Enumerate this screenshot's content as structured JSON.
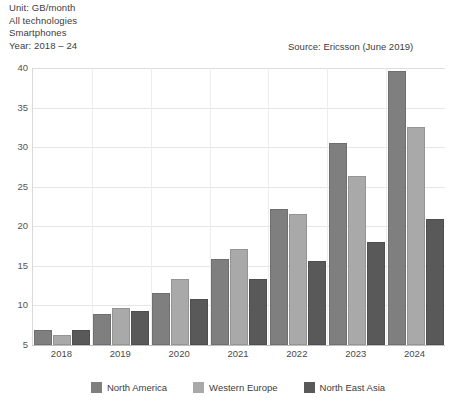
{
  "header": {
    "lines": [
      "Unit: GB/month",
      "All technologies",
      "Smartphones",
      "Year: 2018 – 24"
    ],
    "source": "Source: Ericsson (June 2019)"
  },
  "chart_data": {
    "type": "bar",
    "title": "",
    "subtitle": "",
    "xlabel": "",
    "ylabel": "",
    "unit": "GB/month",
    "categories": [
      "2018",
      "2019",
      "2020",
      "2021",
      "2022",
      "2023",
      "2024"
    ],
    "series": [
      {
        "name": "North America",
        "color": "#7f7f7f",
        "values": [
          6.9,
          8.9,
          11.6,
          15.9,
          22.2,
          30.5,
          39.6
        ]
      },
      {
        "name": "Western Europe",
        "color": "#a9a9a9",
        "values": [
          6.3,
          9.7,
          13.4,
          17.1,
          21.5,
          26.3,
          32.5
        ]
      },
      {
        "name": "North East Asia",
        "color": "#595959",
        "values": [
          6.9,
          9.3,
          10.8,
          13.3,
          15.6,
          18.0,
          20.9
        ]
      }
    ],
    "ylim": [
      5,
      40
    ],
    "yticks": [
      5,
      10,
      15,
      20,
      25,
      30,
      35,
      40
    ],
    "ytick_labels": [
      "5",
      "10",
      "15",
      "20",
      "25",
      "30",
      "35",
      "40"
    ],
    "grid": true,
    "legend_position": "bottom"
  }
}
